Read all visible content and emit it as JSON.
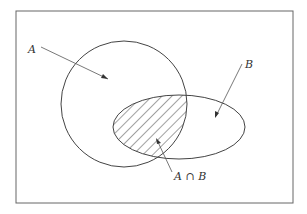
{
  "diagram": {
    "type": "venn",
    "labels": {
      "a": "A",
      "b": "B",
      "intersection": "A ∩ B"
    },
    "colors": {
      "stroke": "#444444",
      "background": "#ffffff"
    }
  }
}
